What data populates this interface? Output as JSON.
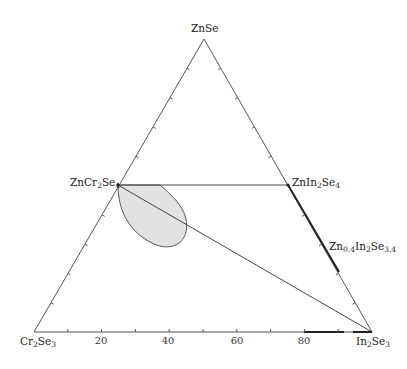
{
  "diagram": {
    "type": "ternary phase diagram",
    "vertices": {
      "top": {
        "formula": "ZnSe",
        "parts": [
          [
            "ZnSe",
            ""
          ]
        ]
      },
      "bottom_left": {
        "formula": "Cr2Se3",
        "parts": [
          [
            "Cr",
            "2"
          ],
          [
            "Se",
            "3"
          ]
        ]
      },
      "bottom_right": {
        "formula": "In2Se3",
        "parts": [
          [
            "In",
            "2"
          ],
          [
            "Se",
            "3"
          ]
        ]
      }
    },
    "compounds": [
      {
        "formula": "ZnCr2Se4",
        "parts": [
          [
            "ZnCr",
            "2"
          ],
          [
            "Se",
            "4"
          ]
        ]
      },
      {
        "formula": "ZnIn2Se4",
        "parts": [
          [
            "ZnIn",
            "2"
          ],
          [
            "Se",
            "4"
          ]
        ]
      },
      {
        "formula": "Zn0.4In2Se3.4",
        "parts": [
          [
            "Zn",
            "0.4"
          ],
          [
            "In",
            "2"
          ],
          [
            "Se",
            "3.4"
          ]
        ]
      }
    ],
    "bottom_axis_ticks": [
      "20",
      "40",
      "60",
      "80"
    ],
    "tie_lines": [
      [
        "ZnCr2Se4",
        "ZnIn2Se4"
      ],
      [
        "ZnCr2Se4",
        "In2Se3"
      ]
    ],
    "shaded_region": "solid-solution field near ZnCr2Se4 (gray lobe)",
    "colors": {
      "line": "#555555",
      "region_fill": "#e2e2e2",
      "region_stroke": "#555555",
      "thick_segment": "#222222"
    }
  }
}
